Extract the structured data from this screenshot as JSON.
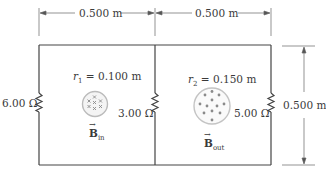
{
  "dimensions": {
    "top_left_width": "0.500 m",
    "top_right_width": "0.500 m",
    "right_height": "0.500 m"
  },
  "resistors": [
    {
      "id": "left",
      "label": "6.00 Ω"
    },
    {
      "id": "middle",
      "label": "3.00 Ω"
    },
    {
      "id": "right",
      "label": "5.00 Ω"
    }
  ],
  "regions": [
    {
      "id": "left",
      "radius_symbol": "r",
      "radius_index": "1",
      "radius_value": "= 0.100 m",
      "field_symbol": "B",
      "field_subscript": "in",
      "field_marker": "cross"
    },
    {
      "id": "right",
      "radius_symbol": "r",
      "radius_index": "2",
      "radius_value": "= 0.150 m",
      "field_symbol": "B",
      "field_subscript": "out",
      "field_marker": "dot"
    }
  ],
  "colors": {
    "wire": "#444444",
    "dimension": "#555555",
    "field_circle": "#bbbbbb",
    "marker": "#8a8a8a",
    "background": "#ffffff"
  }
}
